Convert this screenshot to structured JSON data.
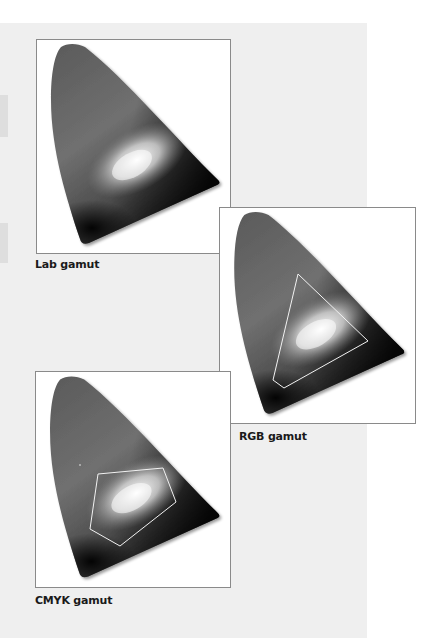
{
  "figure": {
    "panels": [
      {
        "id": "lab",
        "caption": "Lab gamut",
        "overlay": "none"
      },
      {
        "id": "rgb",
        "caption": "RGB gamut",
        "overlay": "triangle"
      },
      {
        "id": "cmyk",
        "caption": "CMYK gamut",
        "overlay": "pentagon"
      }
    ]
  },
  "colors": {
    "page_background": "#efefef",
    "frame_border": "#8a8a8a",
    "gamut_outline": "#f2f2f2",
    "caption_text": "#1a1a1a"
  }
}
